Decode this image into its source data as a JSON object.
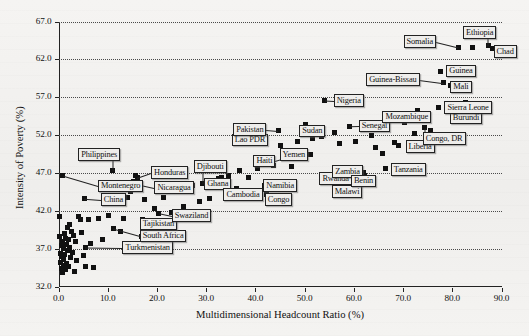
{
  "chart_data": {
    "type": "scatter",
    "title": "",
    "xlabel": "Multidimensional Headcount Ratio (%)",
    "ylabel": "Intensity of Poverty (%)",
    "xlim": [
      0.0,
      90.0
    ],
    "ylim": [
      32.0,
      67.0
    ],
    "xticks": [
      "0.0",
      "10.0",
      "20.0",
      "30.0",
      "40.0",
      "50.0",
      "60.0",
      "70.0",
      "80.0",
      "90.0"
    ],
    "yticks": [
      "32.0",
      "37.0",
      "42.0",
      "47.0",
      "52.0",
      "57.0",
      "62.0",
      "67.0"
    ],
    "grid": "horizontal-dotted",
    "legend": "none",
    "marker": "filled-square",
    "marker_color": "#111111",
    "points": [
      {
        "label": "Montenegro",
        "x": 0.9,
        "y": 46.6,
        "lx": 8.0,
        "ly": 45.3
      },
      {
        "label": "Philippines",
        "x": 11.0,
        "y": 47.3,
        "lx": 4.0,
        "ly": 49.5
      },
      {
        "label": "China",
        "x": 5.2,
        "y": 43.6,
        "lx": 8.6,
        "ly": 43.5
      },
      {
        "label": "Turkmenistan",
        "x": 5.5,
        "y": 37.2,
        "lx": 13.0,
        "ly": 37.2
      },
      {
        "label": "South Africa",
        "x": 11.1,
        "y": 39.6,
        "lx": 16.5,
        "ly": 38.7
      },
      {
        "label": "Tajikistan",
        "x": 17.1,
        "y": 40.9,
        "lx": 16.5,
        "ly": 40.3
      },
      {
        "label": "Swaziland",
        "x": 20.4,
        "y": 41.7,
        "lx": 23.0,
        "ly": 41.4
      },
      {
        "label": "Honduras",
        "x": 16.0,
        "y": 46.4,
        "lx": 18.8,
        "ly": 47.1
      },
      {
        "label": "Nicaragua",
        "x": 16.3,
        "y": 45.5,
        "lx": 19.5,
        "ly": 45.1
      },
      {
        "label": "Djibouti",
        "x": 29.3,
        "y": 45.6,
        "lx": 27.5,
        "ly": 47.9
      },
      {
        "label": "Ghana",
        "x": 32.6,
        "y": 46.3,
        "lx": 29.6,
        "ly": 45.6
      },
      {
        "label": "Cambodia",
        "x": 36.2,
        "y": 45.0,
        "lx": 33.5,
        "ly": 44.2
      },
      {
        "label": "Lao PDR",
        "x": 38.1,
        "y": 51.9,
        "lx": 35.2,
        "ly": 51.4
      },
      {
        "label": "Pakistan",
        "x": 44.6,
        "y": 52.6,
        "lx": 35.5,
        "ly": 52.8
      },
      {
        "label": "Haiti",
        "x": 46.5,
        "y": 49.0,
        "lx": 39.6,
        "ly": 48.6
      },
      {
        "label": "Namibia",
        "x": 41.8,
        "y": 45.3,
        "lx": 41.6,
        "ly": 45.4
      },
      {
        "label": "Congo",
        "x": 42.3,
        "y": 44.1,
        "lx": 41.9,
        "ly": 43.5
      },
      {
        "label": "Yemen",
        "x": 51.1,
        "y": 49.4,
        "lx": 44.9,
        "ly": 49.5
      },
      {
        "label": "Sudan",
        "x": 52.8,
        "y": 52.6,
        "lx": 48.9,
        "ly": 52.6
      },
      {
        "label": "Rwanda",
        "x": 57.3,
        "y": 47.2,
        "lx": 53.0,
        "ly": 46.3
      },
      {
        "label": "Malawi",
        "x": 58.4,
        "y": 45.3,
        "lx": 55.5,
        "ly": 44.6
      },
      {
        "label": "Zambia",
        "x": 61.9,
        "y": 47.0,
        "lx": 55.6,
        "ly": 47.2
      },
      {
        "label": "Benin",
        "x": 62.2,
        "y": 46.6,
        "lx": 59.4,
        "ly": 46.0
      },
      {
        "label": "Nigeria",
        "x": 54.0,
        "y": 56.6,
        "lx": 55.9,
        "ly": 56.6
      },
      {
        "label": "Senegal",
        "x": 59.2,
        "y": 53.1,
        "lx": 61.0,
        "ly": 53.2
      },
      {
        "label": "Tanzania",
        "x": 66.4,
        "y": 47.6,
        "lx": 67.5,
        "ly": 47.5
      },
      {
        "label": "Mozambique",
        "x": 70.2,
        "y": 53.6,
        "lx": 65.8,
        "ly": 54.4
      },
      {
        "label": "Liberia",
        "x": 71.2,
        "y": 50.8,
        "lx": 70.5,
        "ly": 50.5
      },
      {
        "label": "Congo, DR",
        "x": 74.4,
        "y": 53.0,
        "lx": 74.0,
        "ly": 51.6
      },
      {
        "label": "Burundi",
        "x": 80.8,
        "y": 53.9,
        "lx": 79.5,
        "ly": 54.3
      },
      {
        "label": "Sierra Leone",
        "x": 77.3,
        "y": 55.7,
        "lx": 78.4,
        "ly": 55.7
      },
      {
        "label": "Guinea-Bissau",
        "x": 78.3,
        "y": 58.9,
        "lx": 62.5,
        "ly": 59.4
      },
      {
        "label": "Mali",
        "x": 79.6,
        "y": 58.5,
        "lx": 79.6,
        "ly": 58.4
      },
      {
        "label": "Guinea",
        "x": 77.7,
        "y": 60.4,
        "lx": 78.8,
        "ly": 60.5
      },
      {
        "label": "Somalia",
        "x": 81.2,
        "y": 63.6,
        "lx": 70.1,
        "ly": 64.4
      },
      {
        "label": "Ethiopia",
        "x": 87.3,
        "y": 63.8,
        "lx": 82.2,
        "ly": 65.6
      },
      {
        "label": "Chad",
        "x": 88.2,
        "y": 63.4,
        "lx": 88.4,
        "ly": 63.1
      }
    ],
    "unlabeled_points": [
      {
        "x": 0.3,
        "y": 38.6
      },
      {
        "x": 0.4,
        "y": 36.4
      },
      {
        "x": 0.5,
        "y": 35.2
      },
      {
        "x": 0.6,
        "y": 34.4
      },
      {
        "x": 0.6,
        "y": 37.4
      },
      {
        "x": 0.7,
        "y": 36.0
      },
      {
        "x": 0.8,
        "y": 38.0
      },
      {
        "x": 0.9,
        "y": 33.9
      },
      {
        "x": 1.0,
        "y": 35.6
      },
      {
        "x": 1.1,
        "y": 37.0
      },
      {
        "x": 1.1,
        "y": 34.8
      },
      {
        "x": 1.2,
        "y": 39.0
      },
      {
        "x": 1.3,
        "y": 36.2
      },
      {
        "x": 1.4,
        "y": 38.4
      },
      {
        "x": 1.5,
        "y": 34.2
      },
      {
        "x": 1.6,
        "y": 37.6
      },
      {
        "x": 1.7,
        "y": 35.0
      },
      {
        "x": 1.8,
        "y": 39.8
      },
      {
        "x": 1.9,
        "y": 36.8
      },
      {
        "x": 2.0,
        "y": 38.2
      },
      {
        "x": 2.1,
        "y": 34.6
      },
      {
        "x": 2.2,
        "y": 40.2
      },
      {
        "x": 2.3,
        "y": 37.2
      },
      {
        "x": 2.5,
        "y": 35.8
      },
      {
        "x": 2.6,
        "y": 39.3
      },
      {
        "x": 2.8,
        "y": 36.5
      },
      {
        "x": 3.0,
        "y": 38.8
      },
      {
        "x": 3.2,
        "y": 34.0
      },
      {
        "x": 3.4,
        "y": 37.9
      },
      {
        "x": 3.6,
        "y": 35.4
      },
      {
        "x": 0.2,
        "y": 41.3
      },
      {
        "x": 4.1,
        "y": 41.2
      },
      {
        "x": 4.4,
        "y": 40.8
      },
      {
        "x": 4.7,
        "y": 39.1
      },
      {
        "x": 5.0,
        "y": 36.1
      },
      {
        "x": 5.4,
        "y": 34.7
      },
      {
        "x": 6.0,
        "y": 40.9
      },
      {
        "x": 6.6,
        "y": 37.7
      },
      {
        "x": 7.2,
        "y": 34.5
      },
      {
        "x": 8.1,
        "y": 41.0
      },
      {
        "x": 9.0,
        "y": 38.2
      },
      {
        "x": 10.2,
        "y": 41.4
      },
      {
        "x": 12.6,
        "y": 39.2
      },
      {
        "x": 13.2,
        "y": 41.0
      },
      {
        "x": 14.0,
        "y": 43.8
      },
      {
        "x": 14.6,
        "y": 44.6
      },
      {
        "x": 15.2,
        "y": 45.9
      },
      {
        "x": 15.6,
        "y": 46.7
      },
      {
        "x": 16.8,
        "y": 38.6
      },
      {
        "x": 17.4,
        "y": 43.5
      },
      {
        "x": 18.6,
        "y": 39.9
      },
      {
        "x": 19.6,
        "y": 42.3
      },
      {
        "x": 21.4,
        "y": 43.8
      },
      {
        "x": 23.0,
        "y": 41.8
      },
      {
        "x": 25.4,
        "y": 42.6
      },
      {
        "x": 27.2,
        "y": 45.4
      },
      {
        "x": 28.6,
        "y": 43.2
      },
      {
        "x": 30.6,
        "y": 43.6
      },
      {
        "x": 33.2,
        "y": 46.4
      },
      {
        "x": 34.6,
        "y": 46.6
      },
      {
        "x": 36.8,
        "y": 47.3
      },
      {
        "x": 38.6,
        "y": 46.4
      },
      {
        "x": 39.4,
        "y": 44.4
      },
      {
        "x": 40.4,
        "y": 47.6
      },
      {
        "x": 43.6,
        "y": 48.0
      },
      {
        "x": 45.2,
        "y": 50.6
      },
      {
        "x": 47.4,
        "y": 47.9
      },
      {
        "x": 48.6,
        "y": 51.2
      },
      {
        "x": 50.2,
        "y": 53.4
      },
      {
        "x": 51.6,
        "y": 51.6
      },
      {
        "x": 53.4,
        "y": 51.8
      },
      {
        "x": 56.0,
        "y": 52.4
      },
      {
        "x": 57.0,
        "y": 50.9
      },
      {
        "x": 60.4,
        "y": 51.1
      },
      {
        "x": 63.6,
        "y": 52.0
      },
      {
        "x": 64.4,
        "y": 50.3
      },
      {
        "x": 65.8,
        "y": 49.6
      },
      {
        "x": 68.2,
        "y": 51.0
      },
      {
        "x": 69.0,
        "y": 50.6
      },
      {
        "x": 72.4,
        "y": 52.2
      },
      {
        "x": 73.0,
        "y": 55.3
      },
      {
        "x": 75.6,
        "y": 52.6
      },
      {
        "x": 76.4,
        "y": 51.6
      },
      {
        "x": 82.6,
        "y": 56.3
      },
      {
        "x": 84.2,
        "y": 63.6
      }
    ]
  }
}
